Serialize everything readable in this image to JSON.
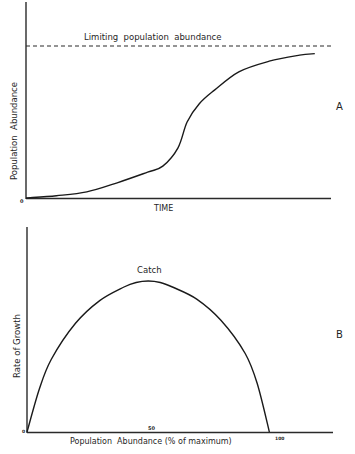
{
  "figure": {
    "panel_a": {
      "panel_label": "A",
      "ylabel": "Population  Abundance",
      "xlabel": "TIME",
      "origin_label": "0",
      "limit_label": "Limiting  population  abundance"
    },
    "panel_b": {
      "panel_label": "B",
      "ylabel": "Rate of Growth",
      "xlabel": "Population  Abundance (% of maximum)",
      "origin_label": "0",
      "tick_50": "50",
      "tick_100": "100",
      "peak_label": "Catch"
    }
  },
  "chart_data": [
    {
      "type": "line",
      "title": "Logistic population growth",
      "panel": "A",
      "xlabel": "TIME",
      "ylabel": "Population Abundance",
      "xlim": [
        0,
        100
      ],
      "ylim": [
        0,
        100
      ],
      "grid": false,
      "annotations": [
        {
          "text": "Limiting population abundance",
          "type": "dashed-horizontal-line",
          "y": 100
        }
      ],
      "series": [
        {
          "name": "population",
          "x": [
            0,
            10,
            20,
            30,
            40,
            45,
            50,
            53,
            57,
            62,
            70,
            80,
            90,
            95
          ],
          "y": [
            0,
            1.5,
            4,
            10,
            17,
            21,
            33,
            50,
            62,
            71,
            83,
            90,
            94,
            95
          ]
        }
      ]
    },
    {
      "type": "line",
      "title": "Growth rate vs population abundance",
      "panel": "B",
      "xlabel": "Population Abundance (% of maximum)",
      "ylabel": "Rate of Growth",
      "xlim": [
        0,
        125
      ],
      "ylim": [
        0,
        100
      ],
      "x_ticks": [
        0,
        50,
        100
      ],
      "grid": false,
      "annotations": [
        {
          "text": "Catch",
          "x": 50,
          "y": 100
        }
      ],
      "series": [
        {
          "name": "rate of growth",
          "x": [
            0,
            5,
            10,
            20,
            30,
            40,
            45,
            50,
            55,
            60,
            70,
            80,
            90,
            95,
            100
          ],
          "y": [
            0,
            28,
            48,
            72,
            87,
            96,
            99,
            100,
            99,
            96,
            88,
            74,
            52,
            32,
            0
          ]
        }
      ]
    }
  ]
}
